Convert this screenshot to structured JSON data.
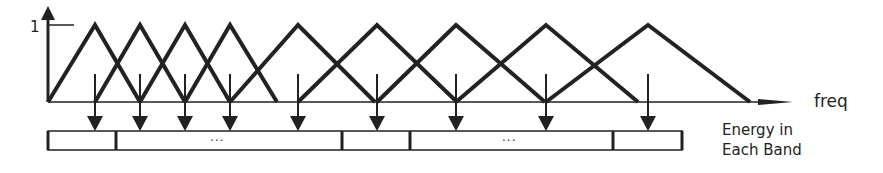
{
  "diagram": {
    "y_axis_label": "1",
    "x_axis_label": "freq",
    "caption_line1": "Energy in",
    "caption_line2": "Each Band",
    "ellipsis_1": "...",
    "ellipsis_2": "...",
    "stroke_color": "#222222",
    "filters": [
      {
        "start": 48,
        "peak": 95,
        "end": 140
      },
      {
        "start": 95,
        "peak": 140,
        "end": 185
      },
      {
        "start": 140,
        "peak": 185,
        "end": 230
      },
      {
        "start": 185,
        "peak": 230,
        "end": 277
      },
      {
        "start": 230,
        "peak": 298,
        "end": 375
      },
      {
        "start": 298,
        "peak": 377,
        "end": 457
      },
      {
        "start": 377,
        "peak": 456,
        "end": 545
      },
      {
        "start": 456,
        "peak": 546,
        "end": 638
      },
      {
        "start": 546,
        "peak": 648,
        "end": 750
      }
    ],
    "arrows_x": [
      95,
      140,
      185,
      230,
      298,
      377,
      456,
      546,
      648
    ],
    "band_box": {
      "x0": 48,
      "x1": 682,
      "y0": 131,
      "y1": 150
    },
    "band_dividers": [
      116,
      342,
      410,
      613
    ]
  }
}
